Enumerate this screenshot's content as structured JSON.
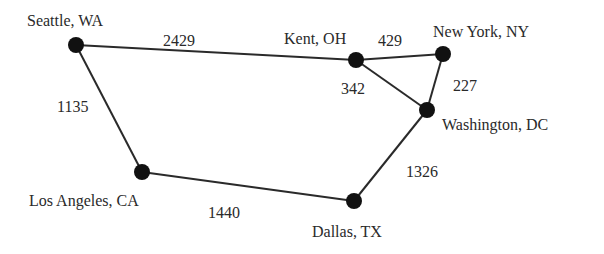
{
  "diagram": {
    "type": "weighted-graph",
    "nodes": [
      {
        "id": "seattle",
        "label": "Seattle, WA",
        "x": 76,
        "y": 45,
        "lx": 27,
        "ly": 13
      },
      {
        "id": "kent",
        "label": "Kent, OH",
        "x": 356,
        "y": 60,
        "lx": 284,
        "ly": 31
      },
      {
        "id": "newyork",
        "label": "New York, NY",
        "x": 443,
        "y": 54,
        "lx": 433,
        "ly": 24
      },
      {
        "id": "washington",
        "label": "Washington, DC",
        "x": 427,
        "y": 110,
        "lx": 442,
        "ly": 117
      },
      {
        "id": "losangeles",
        "label": "Los Angeles, CA",
        "x": 142,
        "y": 172,
        "lx": 29,
        "ly": 193
      },
      {
        "id": "dallas",
        "label": "Dallas, TX",
        "x": 354,
        "y": 201,
        "lx": 312,
        "ly": 224
      }
    ],
    "edges": [
      {
        "from": "seattle",
        "to": "kent",
        "weight": "2429",
        "lx": 163,
        "ly": 33
      },
      {
        "from": "kent",
        "to": "newyork",
        "weight": "429",
        "lx": 378,
        "ly": 33
      },
      {
        "from": "kent",
        "to": "washington",
        "weight": "342",
        "lx": 341,
        "ly": 81
      },
      {
        "from": "newyork",
        "to": "washington",
        "weight": "227",
        "lx": 453,
        "ly": 78
      },
      {
        "from": "seattle",
        "to": "losangeles",
        "weight": "1135",
        "lx": 57,
        "ly": 99
      },
      {
        "from": "losangeles",
        "to": "dallas",
        "weight": "1440",
        "lx": 208,
        "ly": 205
      },
      {
        "from": "dallas",
        "to": "washington",
        "weight": "1326",
        "lx": 406,
        "ly": 164
      }
    ]
  }
}
